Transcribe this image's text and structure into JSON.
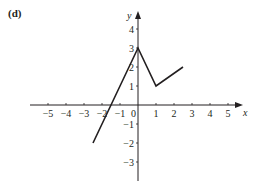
{
  "chart_data": {
    "type": "line",
    "title": "(d)",
    "xlabel": "x",
    "ylabel": "y",
    "xlim": [
      -5.5,
      5.5
    ],
    "ylim": [
      -3.5,
      4.5
    ],
    "grid": false,
    "legend": null,
    "x_ticks": [
      -5,
      -4,
      -3,
      -2,
      -1,
      0,
      1,
      2,
      3,
      4,
      5
    ],
    "x_tick_labels": [
      "−5",
      "−4",
      "−3",
      "−2",
      "−1",
      "0",
      "1",
      "2",
      "3",
      "4",
      "5"
    ],
    "y_ticks": [
      -3,
      -2,
      -1,
      1,
      2,
      3,
      4
    ],
    "y_tick_labels": [
      "−3",
      "−2",
      "−1",
      "1",
      "2",
      "3",
      "4"
    ],
    "series": [
      {
        "name": "piecewise",
        "x": [
          -2.5,
          0,
          1,
          2.5
        ],
        "y": [
          -2,
          3,
          1,
          2
        ]
      }
    ]
  },
  "labels": {
    "panel": "(d)",
    "x_axis": "x",
    "y_axis": "y",
    "origin": "0"
  }
}
